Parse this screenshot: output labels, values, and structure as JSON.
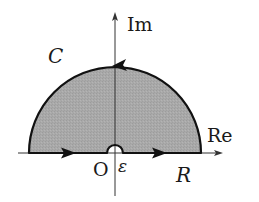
{
  "diagram": {
    "type": "contour-integral-semicircle",
    "labels": {
      "imag_axis": "Im",
      "real_axis": "Re",
      "contour": "C",
      "origin": "O",
      "epsilon": "ε",
      "radius": "R"
    },
    "geometry": {
      "origin": [
        115,
        153
      ],
      "outer_radius": 86,
      "inner_radius": 8,
      "real_axis_range": [
        18,
        222
      ],
      "imag_axis_range": [
        12,
        196
      ]
    },
    "colors": {
      "fill": "#a9a9a9",
      "stroke": "#111111",
      "axis": "#333333",
      "background": "#ffffff"
    },
    "arrows": [
      {
        "location": "real-axis-left-segment",
        "direction": "right"
      },
      {
        "location": "real-axis-right-segment",
        "direction": "right"
      },
      {
        "location": "arc-top",
        "direction": "left"
      }
    ]
  }
}
